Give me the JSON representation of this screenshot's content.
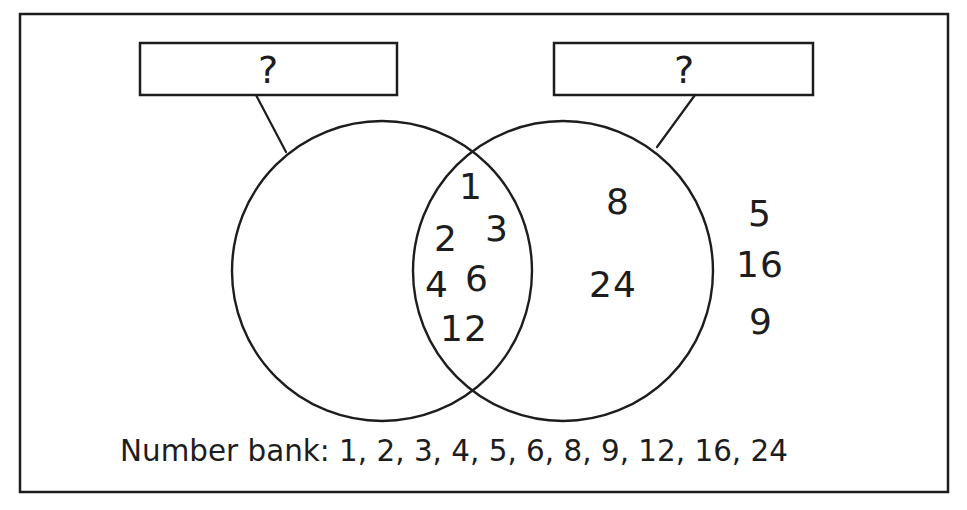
{
  "colors": {
    "ink": "#1d1d1d",
    "background": "#ffffff"
  },
  "labels": {
    "left_box_text": "?",
    "right_box_text": "?"
  },
  "venn": {
    "left_circle_numbers": [],
    "intersection_numbers": [
      "1",
      "3",
      "2",
      "6",
      "4",
      "12"
    ],
    "right_circle_numbers": [
      "8",
      "24"
    ],
    "outside_numbers": [
      "5",
      "16",
      "9"
    ]
  },
  "number_bank": {
    "text": "Number bank: 1, 2, 3, 4, 5, 6, 8, 9, 12, 16, 24"
  }
}
